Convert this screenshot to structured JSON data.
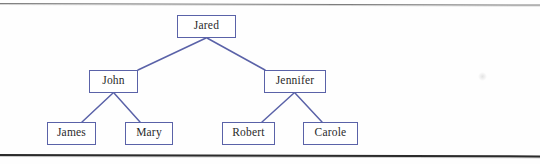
{
  "figure": {
    "type": "family-tree-diagram",
    "title": "",
    "border_color": "#5a62a8",
    "edge_color": "#5a62a8",
    "text_color": "#2a2a2a",
    "background": "#fefefe",
    "rule_top_color": "#7d7d7d",
    "rule_bottom_color": "#2b2b2b"
  },
  "nodes": [
    {
      "id": "jared",
      "label": "Jared",
      "level": 0,
      "x": 177,
      "y": 15,
      "w": 59,
      "h": 23
    },
    {
      "id": "john",
      "label": "John",
      "level": 1,
      "x": 89,
      "y": 70,
      "w": 49,
      "h": 23
    },
    {
      "id": "jennifer",
      "label": "Jennifer",
      "level": 1,
      "x": 264,
      "y": 70,
      "w": 62,
      "h": 23
    },
    {
      "id": "james",
      "label": "James",
      "level": 2,
      "x": 47,
      "y": 122,
      "w": 49,
      "h": 23
    },
    {
      "id": "mary",
      "label": "Mary",
      "level": 2,
      "x": 125,
      "y": 122,
      "w": 48,
      "h": 23
    },
    {
      "id": "robert",
      "label": "Robert",
      "level": 2,
      "x": 222,
      "y": 122,
      "w": 53,
      "h": 23
    },
    {
      "id": "carole",
      "label": "Carole",
      "level": 2,
      "x": 303,
      "y": 122,
      "w": 55,
      "h": 23
    }
  ],
  "edges": [
    {
      "id": "jared-john",
      "from": "jared",
      "to": "john",
      "x1": 206,
      "y1": 38,
      "x2": 138,
      "y2": 70
    },
    {
      "id": "jared-jennifer",
      "from": "jared",
      "to": "jennifer",
      "x1": 207,
      "y1": 38,
      "x2": 265,
      "y2": 70
    },
    {
      "id": "john-james",
      "from": "john",
      "to": "james",
      "x1": 113,
      "y1": 93,
      "x2": 82,
      "y2": 122
    },
    {
      "id": "john-mary",
      "from": "john",
      "to": "mary",
      "x1": 114,
      "y1": 93,
      "x2": 140,
      "y2": 122
    },
    {
      "id": "jennifer-robert",
      "from": "jennifer",
      "to": "robert",
      "x1": 294,
      "y1": 93,
      "x2": 262,
      "y2": 122
    },
    {
      "id": "jennifer-carole",
      "from": "jennifer",
      "to": "carole",
      "x1": 295,
      "y1": 93,
      "x2": 322,
      "y2": 122
    }
  ]
}
